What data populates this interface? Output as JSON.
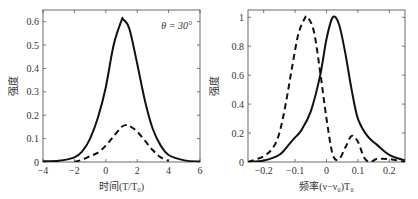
{
  "chart_data": [
    {
      "type": "line",
      "title": "",
      "annotation": "θ = 30°",
      "xlabel": "时间(T/T₀)",
      "ylabel": "强度",
      "xlim": [
        -4,
        6
      ],
      "ylim": [
        0,
        0.65
      ],
      "xticks": [
        "-4",
        "-2",
        "0",
        "2",
        "4",
        "6"
      ],
      "yticks": [
        "0",
        "0.1",
        "0.2",
        "0.3",
        "0.4",
        "0.5",
        "0.6"
      ],
      "grid": false,
      "series": [
        {
          "name": "solid",
          "style": "solid",
          "x": [
            -4,
            -3,
            -2,
            -1.5,
            -1,
            -0.5,
            0,
            0.5,
            1,
            1.1,
            1.5,
            2,
            2.5,
            3,
            3.5,
            4,
            5,
            6
          ],
          "y": [
            0.003,
            0.005,
            0.02,
            0.045,
            0.1,
            0.19,
            0.32,
            0.5,
            0.605,
            0.61,
            0.57,
            0.42,
            0.26,
            0.14,
            0.07,
            0.03,
            0.007,
            0.002
          ]
        },
        {
          "name": "dashed",
          "style": "dashed",
          "x": [
            -2,
            -1.5,
            -1,
            -0.5,
            0,
            0.5,
            1,
            1.3,
            1.5,
            2,
            2.5,
            3,
            3.5,
            4
          ],
          "y": [
            0.0,
            0.01,
            0.025,
            0.04,
            0.07,
            0.11,
            0.15,
            0.158,
            0.155,
            0.13,
            0.09,
            0.05,
            0.02,
            0.005
          ]
        }
      ]
    },
    {
      "type": "line",
      "title": "",
      "xlabel": "频率(ν−ν₀)T₀",
      "ylabel": "强度",
      "xlim": [
        -0.25,
        0.25
      ],
      "ylim": [
        0,
        1.05
      ],
      "xticks": [
        "-0.2",
        "-0.1",
        "0",
        "0.1",
        "0.2"
      ],
      "yticks": [
        "0",
        "0.2",
        "0.4",
        "0.6",
        "0.8",
        "1"
      ],
      "grid": false,
      "series": [
        {
          "name": "solid",
          "style": "solid",
          "x": [
            -0.25,
            -0.2,
            -0.15,
            -0.12,
            -0.1,
            -0.08,
            -0.05,
            -0.02,
            0,
            0.02,
            0.04,
            0.06,
            0.08,
            0.1,
            0.13,
            0.16,
            0.2,
            0.25
          ],
          "y": [
            0.0,
            0.01,
            0.05,
            0.12,
            0.17,
            0.22,
            0.35,
            0.6,
            0.85,
            1.0,
            0.95,
            0.75,
            0.5,
            0.3,
            0.18,
            0.12,
            0.05,
            0.01
          ]
        },
        {
          "name": "dashed",
          "style": "dashed",
          "x": [
            -0.25,
            -0.2,
            -0.17,
            -0.15,
            -0.13,
            -0.11,
            -0.09,
            -0.07,
            -0.06,
            -0.04,
            -0.02,
            0,
            0.02,
            0.04,
            0.06,
            0.08,
            0.1,
            0.12,
            0.14,
            0.16,
            0.2,
            0.25
          ],
          "y": [
            0.0,
            0.04,
            0.1,
            0.2,
            0.4,
            0.65,
            0.88,
            0.99,
            1.0,
            0.9,
            0.62,
            0.3,
            0.05,
            0.02,
            0.1,
            0.18,
            0.14,
            0.03,
            0.0,
            0.02,
            0.02,
            0.0
          ]
        }
      ]
    }
  ]
}
